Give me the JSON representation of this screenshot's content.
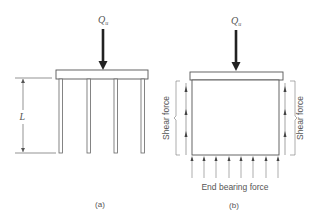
{
  "figure": {
    "panel_a": {
      "load_label": "Q",
      "load_subscript": "u",
      "length_label": "L",
      "caption": "(a)",
      "pile_count": 4
    },
    "panel_b": {
      "load_label": "Q",
      "load_subscript": "u",
      "shear_left_label": "Shear force",
      "shear_right_label": "Shear force",
      "bearing_label": "End bearing force",
      "caption": "(b)",
      "bearing_arrow_count": 8,
      "shear_arrow_count_per_side": 3
    },
    "colors": {
      "line": "#555555",
      "load_arrow": "#222222",
      "text": "#555555"
    }
  }
}
